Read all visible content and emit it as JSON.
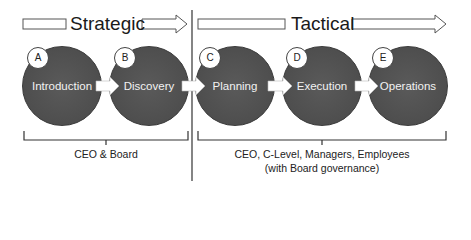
{
  "phases": [
    {
      "label": "Strategic",
      "audience": [
        "CEO & Board"
      ]
    },
    {
      "label": "Tactical",
      "audience": [
        "CEO, C-Level, Managers, Employees",
        "(with Board governance)"
      ]
    }
  ],
  "steps": [
    {
      "letter": "A",
      "label": "Introduction",
      "phase": "Strategic"
    },
    {
      "letter": "B",
      "label": "Discovery",
      "phase": "Strategic"
    },
    {
      "letter": "C",
      "label": "Planning",
      "phase": "Tactical"
    },
    {
      "letter": "D",
      "label": "Execution",
      "phase": "Tactical"
    },
    {
      "letter": "E",
      "label": "Operations",
      "phase": "Tactical"
    }
  ],
  "colors": {
    "circle": "#505050",
    "text_on_circle": "#f2f2f2",
    "line": "#333333"
  }
}
